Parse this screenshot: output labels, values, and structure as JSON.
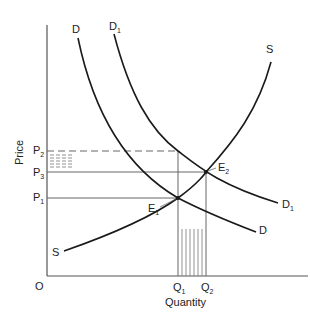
{
  "diagram": {
    "axes": {
      "y_label": "Price",
      "x_label": "Quantity",
      "origin_label": "O"
    },
    "price_levels": [
      {
        "label": "P",
        "sub": "2",
        "style": "dashed"
      },
      {
        "label": "P",
        "sub": "3",
        "style": "solid"
      },
      {
        "label": "P",
        "sub": "1",
        "style": "solid"
      }
    ],
    "quantity_levels": [
      {
        "label": "Q",
        "sub": "1"
      },
      {
        "label": "Q",
        "sub": "2"
      }
    ],
    "curves": {
      "demand": {
        "label": "D"
      },
      "demand_shifted": {
        "label": "D",
        "sub": "1"
      },
      "supply": {
        "label": "S"
      }
    },
    "equilibria": [
      {
        "label": "E",
        "sub": "1"
      },
      {
        "label": "E",
        "sub": "2"
      }
    ],
    "colors": {
      "line": "#1a1a1a",
      "guide": "#555555",
      "hatch": "#777777"
    }
  }
}
